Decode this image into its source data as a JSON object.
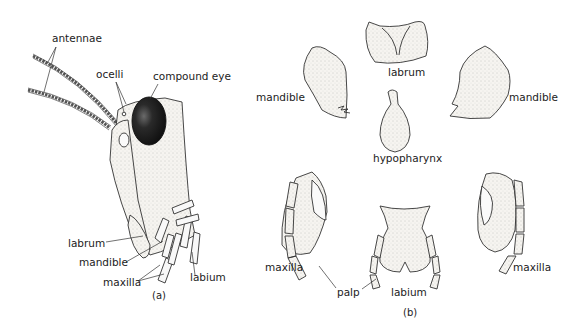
{
  "figure": {
    "panel_a": {
      "caption": "(a)",
      "labels": {
        "antennae": "antennae",
        "ocelli": "ocelli",
        "compound_eye": "compound eye",
        "labrum": "labrum",
        "mandible": "mandible",
        "maxilla": "maxilla",
        "labium": "labium"
      }
    },
    "panel_b": {
      "caption": "(b)",
      "labels": {
        "labrum": "labrum",
        "mandible_left": "mandible",
        "mandible_right": "mandible",
        "hypopharynx": "hypopharynx",
        "maxilla_left": "maxilla",
        "maxilla_right": "maxilla",
        "palp": "palp",
        "labium": "labium"
      }
    }
  },
  "colors": {
    "ink": "#222222",
    "eye": "#1a1a1a",
    "fill": "#f4f2ee"
  }
}
